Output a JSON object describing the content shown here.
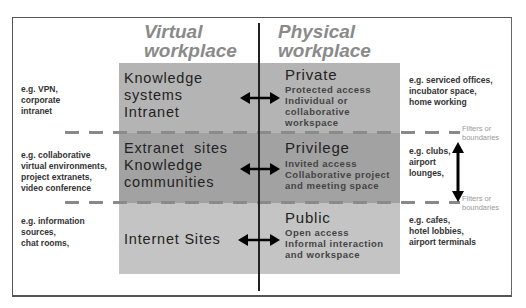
{
  "headers": {
    "virtual": [
      "Virtual",
      "workplace"
    ],
    "physical": [
      "Physical",
      "workplace"
    ]
  },
  "rows": [
    {
      "virtual_label": [
        "Knowledge",
        "systems",
        "Intranet"
      ],
      "physical_title": "Private",
      "physical_desc": [
        "Protected access",
        "Individual or",
        "collaborative",
        "workspace"
      ],
      "left_example": [
        "e.g. VPN,",
        "corporate",
        "intranet"
      ],
      "right_example": [
        "e.g. serviced offices,",
        "incubator space,",
        "home working"
      ]
    },
    {
      "virtual_label": [
        "Extranet  sites",
        "Knowledge",
        "communities"
      ],
      "physical_title": "Privilege",
      "physical_desc": [
        "Invited access",
        "Collaborative project",
        "and meeting space"
      ],
      "left_example": [
        "e.g. collaborative",
        "virtual environments,",
        "project extranets,",
        "video conference"
      ],
      "right_example": [
        "e.g. clubs,",
        "airport",
        "lounges,"
      ]
    },
    {
      "virtual_label": [
        "Internet Sites"
      ],
      "physical_title": "Public",
      "physical_desc": [
        "Open access",
        "Informal interaction",
        "and workspace"
      ],
      "left_example": [
        "e.g. information",
        "sources,",
        "chat rooms,"
      ],
      "right_example": [
        "e.g. cafes,",
        "hotel lobbies,",
        "airport terminals"
      ]
    }
  ],
  "boundaries": {
    "label": [
      "Filters or",
      "boundaries"
    ]
  },
  "colors": {
    "band_private": "#b4b4b4",
    "band_privilege": "#a2a2a2",
    "band_public": "#c4c4c4",
    "header_text": "#8a8a8a",
    "dash": "#8a8a8a"
  }
}
